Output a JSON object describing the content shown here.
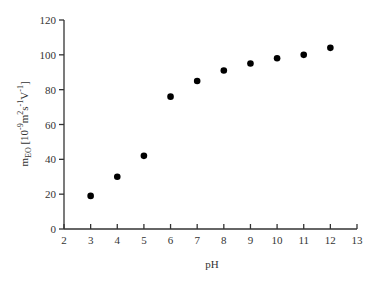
{
  "chart_data": {
    "type": "scatter",
    "title": "",
    "xlabel": "pH",
    "ylabel": "m_EO [10^-9 m^2 s^-1 V^-1]",
    "ylabel_parts": {
      "base": "m",
      "sub": "EO",
      "bracket_open": " [10",
      "exp1": "-9",
      "unit1": "m",
      "exp2": "2",
      "unit2": "s",
      "exp3": "-1",
      "unit3": "V",
      "exp4": "-1",
      "bracket_close": "]"
    },
    "xlim": [
      2,
      13
    ],
    "ylim": [
      0,
      120
    ],
    "x_ticks": [
      2,
      3,
      4,
      5,
      6,
      7,
      8,
      9,
      10,
      11,
      12,
      13
    ],
    "y_ticks": [
      0,
      20,
      40,
      60,
      80,
      100,
      120
    ],
    "grid": false,
    "legend": null,
    "series": [
      {
        "name": "m_EO",
        "marker": "filled-circle",
        "color": "#000000",
        "x": [
          3,
          4,
          5,
          6,
          7,
          8,
          9,
          10,
          11,
          12
        ],
        "y": [
          19,
          30,
          42,
          76,
          85,
          91,
          95,
          98,
          100,
          104
        ]
      }
    ]
  }
}
